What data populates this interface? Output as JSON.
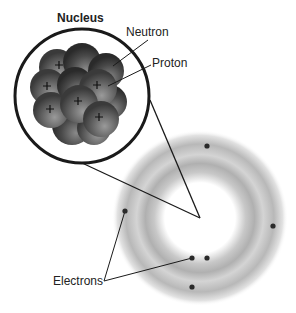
{
  "labels": {
    "nucleus": "Nucleus",
    "neutron": "Neutron",
    "proton": "Proton",
    "electrons": "Electrons"
  },
  "colors": {
    "line": "#1a1a1a",
    "particle_dark": "#3a3a3a",
    "particle_light": "#8a8a8a",
    "cloud": "#b5b5b5",
    "electron": "#2a2a2a"
  },
  "nucleus_circle": {
    "cx": 82,
    "cy": 96,
    "r": 67
  },
  "atom_center": {
    "x": 200,
    "y": 218
  },
  "electrons": [
    {
      "x": 207,
      "y": 146
    },
    {
      "x": 273,
      "y": 226
    },
    {
      "x": 125,
      "y": 211
    },
    {
      "x": 192,
      "y": 258
    },
    {
      "x": 207,
      "y": 258
    },
    {
      "x": 192,
      "y": 287
    }
  ],
  "proton_marks": [
    {
      "x": 59,
      "y": 65
    },
    {
      "x": 47,
      "y": 86
    },
    {
      "x": 97,
      "y": 85
    },
    {
      "x": 78,
      "y": 101
    },
    {
      "x": 50,
      "y": 109
    },
    {
      "x": 99,
      "y": 117
    }
  ]
}
